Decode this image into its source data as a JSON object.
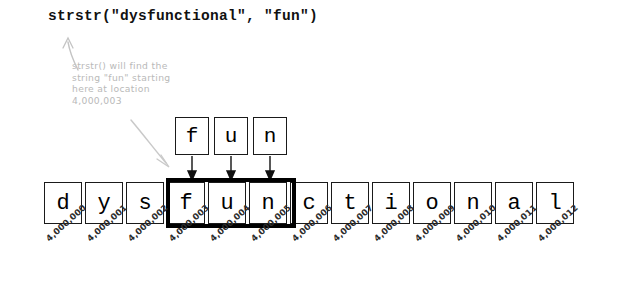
{
  "title": {
    "code": "strstr(\"dysfunctional\", \"fun\")"
  },
  "annotation": {
    "text": "strstr() will find the\nstring \"fun\" starting\nhere at location\n4,000,003",
    "color": "#b9b9b9"
  },
  "needle": {
    "label": "fun",
    "cells": [
      {
        "char": "f"
      },
      {
        "char": "u"
      },
      {
        "char": "n"
      }
    ]
  },
  "haystack": {
    "label": "dysfunctional",
    "cells": [
      {
        "char": "d",
        "address": "4,000,000",
        "matched": false
      },
      {
        "char": "y",
        "address": "4,000,001",
        "matched": false
      },
      {
        "char": "s",
        "address": "4,000,002",
        "matched": false
      },
      {
        "char": "f",
        "address": "4,000,003",
        "matched": true
      },
      {
        "char": "u",
        "address": "4,000,004",
        "matched": true
      },
      {
        "char": "n",
        "address": "4,000,005",
        "matched": true
      },
      {
        "char": "c",
        "address": "4,000,006",
        "matched": false
      },
      {
        "char": "t",
        "address": "4,000,007",
        "matched": false
      },
      {
        "char": "i",
        "address": "4,000,008",
        "matched": false
      },
      {
        "char": "o",
        "address": "4,000,009",
        "matched": false
      },
      {
        "char": "n",
        "address": "4,000,010",
        "matched": false
      },
      {
        "char": "a",
        "address": "4,000,011",
        "matched": false
      },
      {
        "char": "l",
        "address": "4,000,012",
        "matched": false
      }
    ]
  },
  "match": {
    "start_address": "4,000,003",
    "length": 3,
    "outline_color": "#000000"
  },
  "icons": {
    "arrow_up_to_code": "curved-arrow-up-icon",
    "arrow_to_match": "curved-arrow-down-right-icon",
    "mapping_arrows": "arrow-down-icon"
  }
}
